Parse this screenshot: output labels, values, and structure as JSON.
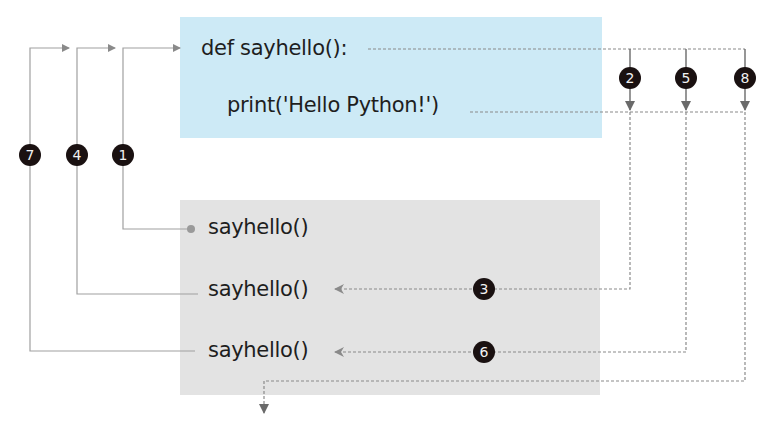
{
  "colors": {
    "def_box": "#cdeaf6",
    "call_box": "#e3e3e3",
    "line": "#8a8a8a",
    "badge": "#1a1111"
  },
  "function_def": {
    "signature": "def sayhello():",
    "body": "print('Hello Python!')"
  },
  "calls": [
    {
      "label": "sayhello()"
    },
    {
      "label": "sayhello()"
    },
    {
      "label": "sayhello()"
    }
  ],
  "steps": {
    "s1": "1",
    "s2": "2",
    "s3": "3",
    "s4": "4",
    "s5": "5",
    "s6": "6",
    "s7": "7",
    "s8": "8"
  }
}
